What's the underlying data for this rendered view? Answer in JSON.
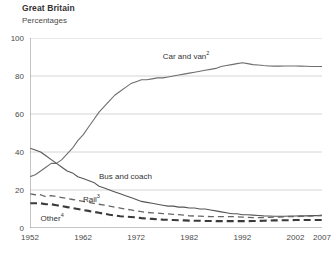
{
  "header": {
    "title": "Great Britain",
    "subtitle": "Percentages"
  },
  "chart_data": {
    "type": "line",
    "title": "Great Britain",
    "subtitle": "Percentages",
    "xlabel": "",
    "ylabel": "Percentages",
    "xlim": [
      1952,
      2007
    ],
    "ylim": [
      0,
      100
    ],
    "grid": true,
    "legend_position": "inline-annotations",
    "y_ticks": [
      "0",
      "20",
      "40",
      "60",
      "80",
      "100"
    ],
    "y_tick_values": [
      0,
      20,
      40,
      60,
      80,
      100
    ],
    "x_ticks": [
      "1952",
      "1962",
      "1972",
      "1982",
      "1992",
      "2002",
      "2007"
    ],
    "x_tick_values": [
      1952,
      1962,
      1972,
      1982,
      1992,
      2002,
      2007
    ],
    "series": [
      {
        "name": "Car and van",
        "label": "Car and van",
        "superscript": "2",
        "style": "solid",
        "color": "#6e6e6e",
        "width": 1.1,
        "label_x": 1977,
        "label_y": 90,
        "x": [
          1952,
          1953,
          1954,
          1955,
          1956,
          1957,
          1958,
          1959,
          1960,
          1961,
          1962,
          1963,
          1964,
          1965,
          1966,
          1967,
          1968,
          1969,
          1970,
          1971,
          1972,
          1973,
          1974,
          1975,
          1976,
          1977,
          1978,
          1979,
          1980,
          1981,
          1982,
          1983,
          1984,
          1985,
          1986,
          1987,
          1988,
          1989,
          1990,
          1991,
          1992,
          1993,
          1994,
          1995,
          1996,
          1997,
          1998,
          1999,
          2000,
          2001,
          2002,
          2003,
          2004,
          2005,
          2006,
          2007
        ],
        "values": [
          27,
          28,
          30,
          32,
          34,
          34,
          36,
          39,
          42,
          46,
          49,
          53,
          57,
          61,
          64,
          67,
          70,
          72,
          74,
          76,
          77,
          78,
          78,
          78.5,
          79,
          79,
          79.5,
          80,
          80.5,
          81,
          81.5,
          82,
          82.5,
          83,
          83.5,
          84,
          85,
          85.5,
          86,
          86.5,
          87,
          86.5,
          86,
          85.8,
          85.5,
          85.3,
          85.2,
          85.2,
          85.3,
          85.3,
          85.3,
          85.2,
          85.1,
          85,
          85,
          85
        ]
      },
      {
        "name": "Bus and coach",
        "label": "Bus and coach",
        "superscript": "",
        "style": "solid",
        "color": "#555555",
        "width": 1.1,
        "label_x": 1965,
        "label_y": 27,
        "x": [
          1952,
          1953,
          1954,
          1955,
          1956,
          1957,
          1958,
          1959,
          1960,
          1961,
          1962,
          1963,
          1964,
          1965,
          1966,
          1967,
          1968,
          1969,
          1970,
          1971,
          1972,
          1973,
          1974,
          1975,
          1976,
          1977,
          1978,
          1979,
          1980,
          1981,
          1982,
          1983,
          1984,
          1985,
          1986,
          1987,
          1988,
          1989,
          1990,
          1991,
          1992,
          1993,
          1994,
          1995,
          1996,
          1997,
          1998,
          1999,
          2000,
          2001,
          2002,
          2003,
          2004,
          2005,
          2006,
          2007
        ],
        "values": [
          42,
          41,
          40,
          38,
          36,
          34,
          32,
          30,
          29,
          27,
          26,
          25,
          24,
          22,
          21,
          20,
          19,
          18,
          17,
          16,
          15,
          14,
          13.5,
          13,
          12.5,
          12,
          11.5,
          11.5,
          11,
          11,
          10.5,
          10.5,
          10,
          10,
          9.5,
          9,
          8.5,
          8,
          7.5,
          7.5,
          7,
          7,
          6.8,
          6.6,
          6.4,
          6.3,
          6.2,
          6.2,
          6.2,
          6.3,
          6.3,
          6.4,
          6.4,
          6.5,
          6.5,
          6.5
        ]
      },
      {
        "name": "Rail",
        "label": "Rail",
        "superscript": "3",
        "style": "dashed",
        "color": "#666666",
        "width": 1.3,
        "label_x": 1962,
        "label_y": 15,
        "x": [
          1952,
          1953,
          1954,
          1955,
          1956,
          1957,
          1958,
          1959,
          1960,
          1961,
          1962,
          1963,
          1964,
          1965,
          1966,
          1967,
          1968,
          1969,
          1970,
          1971,
          1972,
          1973,
          1974,
          1975,
          1976,
          1977,
          1978,
          1979,
          1980,
          1981,
          1982,
          1983,
          1984,
          1985,
          1986,
          1987,
          1988,
          1989,
          1990,
          1991,
          1992,
          1993,
          1994,
          1995,
          1996,
          1997,
          1998,
          1999,
          2000,
          2001,
          2002,
          2003,
          2004,
          2005,
          2006,
          2007
        ],
        "values": [
          18,
          17.5,
          17.5,
          16.5,
          17,
          16.5,
          16,
          15.5,
          15,
          14.5,
          14,
          13.5,
          13,
          12.5,
          12,
          11.5,
          11,
          10.5,
          10,
          9.5,
          9,
          8.6,
          8.2,
          8,
          7.8,
          7.6,
          7.4,
          7.2,
          7,
          6.8,
          6.4,
          6.3,
          6.2,
          6.1,
          6,
          6,
          6,
          6,
          6,
          5.9,
          5.7,
          5.6,
          5.5,
          5.5,
          5.5,
          5.6,
          5.7,
          5.8,
          5.9,
          6,
          6,
          6.1,
          6.2,
          6.3,
          6.5,
          6.7
        ]
      },
      {
        "name": "Other",
        "label": "Other",
        "superscript": "4",
        "style": "dashed",
        "color": "#3a3a3a",
        "width": 2.1,
        "label_x": 1954,
        "label_y": 4.5,
        "x": [
          1952,
          1953,
          1954,
          1955,
          1956,
          1957,
          1958,
          1959,
          1960,
          1961,
          1962,
          1963,
          1964,
          1965,
          1966,
          1967,
          1968,
          1969,
          1970,
          1971,
          1972,
          1973,
          1974,
          1975,
          1976,
          1977,
          1978,
          1979,
          1980,
          1981,
          1982,
          1983,
          1984,
          1985,
          1986,
          1987,
          1988,
          1989,
          1990,
          1991,
          1992,
          1993,
          1994,
          1995,
          1996,
          1997,
          1998,
          1999,
          2000,
          2001,
          2002,
          2003,
          2004,
          2005,
          2006,
          2007
        ],
        "values": [
          13,
          13,
          13,
          12.5,
          12.5,
          12,
          11.5,
          11,
          10.5,
          10,
          9.5,
          9,
          8.5,
          8,
          7.5,
          7,
          6.6,
          6.2,
          6,
          5.8,
          5.6,
          5.2,
          5,
          4.8,
          4.6,
          4.4,
          4.3,
          4.2,
          4.1,
          4,
          3.9,
          3.8,
          3.8,
          3.7,
          3.7,
          3.6,
          3.6,
          3.6,
          3.6,
          3.6,
          3.6,
          3.6,
          3.7,
          3.7,
          3.8,
          3.9,
          4,
          4,
          4.1,
          4.1,
          4.2,
          4.2,
          4.2,
          4.2,
          4.2,
          4.2
        ]
      }
    ]
  }
}
